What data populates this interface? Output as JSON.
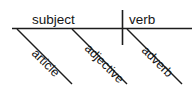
{
  "diagram": {
    "type": "reed-kellogg-sentence-diagram",
    "baseline": {
      "name": "main-horizontal-line",
      "x1": 12,
      "y1": 28.5,
      "x2": 192,
      "y2": 28.5
    },
    "divider": {
      "name": "subject-verb-divider",
      "x1": 122.5,
      "y1": 10,
      "x2": 122.5,
      "y2": 45
    },
    "slots": [
      {
        "id": "subject",
        "label": "subject",
        "x": 32,
        "y": 24,
        "anchor": "start"
      },
      {
        "id": "verb",
        "label": "verb",
        "x": 129,
        "y": 24,
        "anchor": "start"
      }
    ],
    "modifiers": [
      {
        "id": "article",
        "label": "article",
        "line": {
          "x1": 17,
          "y1": 29,
          "x2": 72,
          "y2": 84
        },
        "label_x": 31,
        "label_y": 54,
        "rotate": 45
      },
      {
        "id": "adjective",
        "label": "adjective",
        "line": {
          "x1": 72,
          "y1": 29,
          "x2": 127,
          "y2": 84
        },
        "label_x": 84,
        "label_y": 49,
        "rotate": 45
      },
      {
        "id": "adverb",
        "label": "adverb",
        "line": {
          "x1": 127,
          "y1": 29,
          "x2": 182,
          "y2": 84
        },
        "label_x": 141,
        "label_y": 51,
        "rotate": 45
      }
    ],
    "colors": {
      "ink": "#1c1c1c",
      "background": "#ffffff"
    }
  }
}
